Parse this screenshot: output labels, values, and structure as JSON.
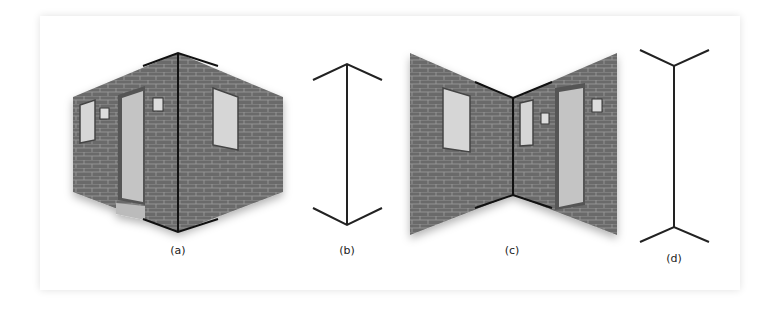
{
  "figure": {
    "panels": [
      {
        "id": "a",
        "label": "(a)",
        "description": "Outside corner of brick building with door, windows, lamps; corner edge highlighted"
      },
      {
        "id": "b",
        "label": "(b)",
        "description": "Muller-Lyer line with arrowheads pointing outward (inward fins)"
      },
      {
        "id": "c",
        "label": "(c)",
        "description": "Inside corner of brick room with window, door, lamps; corner edge highlighted"
      },
      {
        "id": "d",
        "label": "(d)",
        "description": "Muller-Lyer line with fins pointing outward"
      }
    ],
    "colors": {
      "brick": "#6a6a6a",
      "mortar": "#9a9a9a",
      "line": "#1a1a1a",
      "door": "#c8c8c8",
      "window": "#d8d8d8"
    }
  }
}
